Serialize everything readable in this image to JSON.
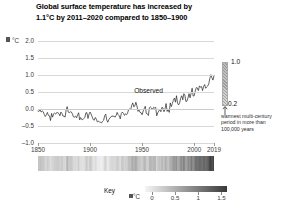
{
  "title": {
    "line1": "Global surface temperature has increased by",
    "line2": "1.1°C by 2011–2020 compared to 1850–1900"
  },
  "axis": {
    "y_unit": "°C",
    "y_ticks": [
      "2.0",
      "1.5",
      "1.0",
      "0.5",
      "0.0",
      "–0.5",
      "–1.0"
    ],
    "x_ticks": [
      "1850",
      "1900",
      "1950",
      "2000",
      "2019"
    ]
  },
  "annotations": {
    "observed": "Observed",
    "range_top": "1.0",
    "range_bottom": "0.2",
    "range_note_line1": "warmest multi-century",
    "range_note_line2": "period in more than",
    "range_note_line3": "100,000 years"
  },
  "key": {
    "label": "Key",
    "unit": "°C",
    "ticks": [
      "0",
      "0.5",
      "1",
      "1.5"
    ]
  },
  "colors": {
    "text": "#111111",
    "axis_text": "#3b3b3b",
    "grid": "#d8d8d8",
    "line": "#222222",
    "stripe_cold": "#f2f2f2",
    "stripe_warm": "#3a3a3a"
  },
  "chart_data": {
    "type": "line",
    "title": "Global surface temperature has increased by 1.1°C by 2011–2020 compared to 1850–1900",
    "xlabel": "",
    "ylabel": "°C",
    "xlim": [
      1850,
      2019
    ],
    "ylim": [
      -1.0,
      2.0
    ],
    "grid": true,
    "legend": "none",
    "series": [
      {
        "name": "Observed",
        "x": [
          1850,
          1851,
          1852,
          1853,
          1854,
          1855,
          1856,
          1857,
          1858,
          1859,
          1860,
          1861,
          1862,
          1863,
          1864,
          1865,
          1866,
          1867,
          1868,
          1869,
          1870,
          1871,
          1872,
          1873,
          1874,
          1875,
          1876,
          1877,
          1878,
          1879,
          1880,
          1881,
          1882,
          1883,
          1884,
          1885,
          1886,
          1887,
          1888,
          1889,
          1890,
          1891,
          1892,
          1893,
          1894,
          1895,
          1896,
          1897,
          1898,
          1899,
          1900,
          1901,
          1902,
          1903,
          1904,
          1905,
          1906,
          1907,
          1908,
          1909,
          1910,
          1911,
          1912,
          1913,
          1914,
          1915,
          1916,
          1917,
          1918,
          1919,
          1920,
          1921,
          1922,
          1923,
          1924,
          1925,
          1926,
          1927,
          1928,
          1929,
          1930,
          1931,
          1932,
          1933,
          1934,
          1935,
          1936,
          1937,
          1938,
          1939,
          1940,
          1941,
          1942,
          1943,
          1944,
          1945,
          1946,
          1947,
          1948,
          1949,
          1950,
          1951,
          1952,
          1953,
          1954,
          1955,
          1956,
          1957,
          1958,
          1959,
          1960,
          1961,
          1962,
          1963,
          1964,
          1965,
          1966,
          1967,
          1968,
          1969,
          1970,
          1971,
          1972,
          1973,
          1974,
          1975,
          1976,
          1977,
          1978,
          1979,
          1980,
          1981,
          1982,
          1983,
          1984,
          1985,
          1986,
          1987,
          1988,
          1989,
          1990,
          1991,
          1992,
          1993,
          1994,
          1995,
          1996,
          1997,
          1998,
          1999,
          2000,
          2001,
          2002,
          2003,
          2004,
          2005,
          2006,
          2007,
          2008,
          2009,
          2010,
          2011,
          2012,
          2013,
          2014,
          2015,
          2016,
          2017,
          2018,
          2019
        ],
        "y": [
          -0.06,
          -0.07,
          -0.02,
          -0.09,
          -0.06,
          -0.08,
          -0.16,
          -0.22,
          -0.17,
          -0.1,
          -0.19,
          -0.2,
          -0.34,
          -0.13,
          -0.24,
          -0.14,
          -0.12,
          -0.15,
          -0.1,
          -0.11,
          -0.13,
          -0.2,
          -0.09,
          -0.13,
          -0.21,
          -0.21,
          -0.24,
          -0.03,
          0.07,
          -0.09,
          -0.11,
          -0.08,
          -0.09,
          -0.14,
          -0.23,
          -0.24,
          -0.21,
          -0.26,
          -0.18,
          -0.11,
          -0.32,
          -0.25,
          -0.31,
          -0.31,
          -0.28,
          -0.25,
          -0.11,
          -0.11,
          -0.28,
          -0.15,
          -0.09,
          -0.15,
          -0.23,
          -0.31,
          -0.33,
          -0.25,
          -0.3,
          -0.38,
          -0.36,
          -0.38,
          -0.39,
          -0.41,
          -0.36,
          -0.33,
          -0.2,
          -0.15,
          -0.32,
          -0.39,
          -0.31,
          -0.26,
          -0.24,
          -0.2,
          -0.22,
          -0.21,
          -0.24,
          -0.19,
          -0.1,
          -0.17,
          -0.2,
          -0.29,
          -0.13,
          -0.09,
          -0.13,
          -0.19,
          -0.14,
          -0.17,
          -0.12,
          -0.02,
          0.0,
          -0.02,
          0.11,
          0.18,
          0.06,
          0.09,
          0.2,
          0.09,
          -0.07,
          -0.03,
          -0.1,
          -0.11,
          -0.17,
          -0.06,
          0.01,
          0.08,
          -0.13,
          -0.14,
          -0.19,
          0.04,
          0.06,
          0.03,
          -0.02,
          0.05,
          0.03,
          0.05,
          -0.2,
          -0.11,
          -0.06,
          -0.02,
          -0.08,
          0.05,
          0.03,
          -0.08,
          0.01,
          0.16,
          -0.07,
          -0.01,
          -0.1,
          0.18,
          0.07,
          0.16,
          0.26,
          0.32,
          0.2,
          0.39,
          0.17,
          0.12,
          0.18,
          0.32,
          0.39,
          0.27,
          0.45,
          0.41,
          0.22,
          0.23,
          0.32,
          0.45,
          0.33,
          0.46,
          0.61,
          0.38,
          0.39,
          0.53,
          0.63,
          0.62,
          0.54,
          0.68,
          0.64,
          0.66,
          0.54,
          0.66,
          0.72,
          0.61,
          0.65,
          0.68,
          0.74,
          0.9,
          1.01,
          0.92,
          0.85,
          0.98
        ],
        "units": "°C anomaly relative to 1850–1900"
      }
    ],
    "range_marker": {
      "label": "warmest multi-century period in more than 100,000 years",
      "low": 0.2,
      "high": 1.0
    },
    "stripes": {
      "description": "warming stripes band, 1850–2019, light (cool) to dark (warm)",
      "vmin": 0,
      "vmax": 1.5
    },
    "colorbar": {
      "ticks": [
        0,
        0.5,
        1,
        1.5
      ],
      "unit": "°C"
    }
  }
}
